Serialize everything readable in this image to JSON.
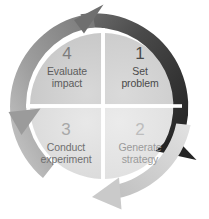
{
  "diagram": {
    "type": "cycle",
    "center": {
      "x": 103,
      "y": 106
    },
    "inner_radius": 73,
    "arc_radius": 94,
    "arc_width": 13,
    "background_color": "#ffffff",
    "quadrants": [
      {
        "id": "q1",
        "position": "top-right",
        "number": "1",
        "line1": "Set",
        "line2": "problem",
        "fill_color": "#d2d2d2",
        "text_color": "#4a4a4a",
        "number_color": "#4a4a4a"
      },
      {
        "id": "q2",
        "position": "bottom-right",
        "number": "2",
        "line1": "Generate",
        "line2": "strategy",
        "fill_color": "#e4e4e4",
        "text_color": "#9a9a9a",
        "number_color": "#bdbdbd"
      },
      {
        "id": "q3",
        "position": "bottom-left",
        "number": "3",
        "line1": "Conduct",
        "line2": "experiment",
        "fill_color": "#e0e0e0",
        "text_color": "#6f6f6f",
        "number_color": "#a8a8a8"
      },
      {
        "id": "q4",
        "position": "top-left",
        "number": "4",
        "line1": "Evaluate",
        "line2": "impact",
        "fill_color": "#cfcfcf",
        "text_color": "#5c5c5c",
        "number_color": "#7d7d7d"
      }
    ],
    "arrows": [
      {
        "id": "arrow-dark",
        "label": "top-to-right-arrow",
        "color_start": "#6a6a6a",
        "color_end": "#242424",
        "start_angle_deg": -103,
        "end_angle_deg": 46,
        "head_direction": "down-right"
      },
      {
        "id": "arrow-light",
        "label": "right-to-bottom-left-arrow",
        "color_start": "#dcdcdc",
        "color_end": "#c2c2c2",
        "start_angle_deg": 20,
        "end_angle_deg": 160,
        "head_direction": "left"
      },
      {
        "id": "arrow-medium",
        "label": "left-to-top-arrow",
        "color_start": "#c6c6c6",
        "color_end": "#7c7c7c",
        "start_angle_deg": 140,
        "end_angle_deg": 272,
        "head_direction": "up-right"
      }
    ]
  }
}
